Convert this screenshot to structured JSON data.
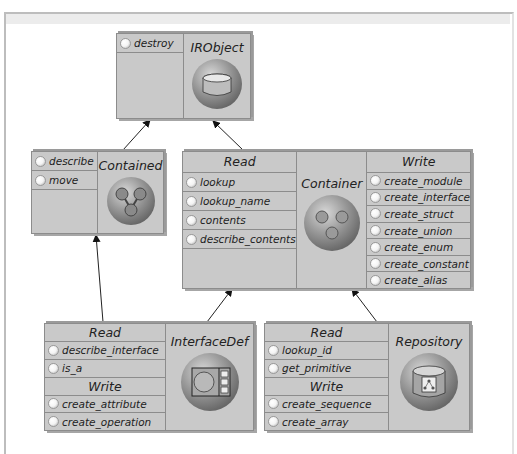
{
  "diagram": {
    "boxes": {
      "irobject": {
        "title": "IRObject",
        "icon": "cylinder-icon",
        "sections": [
          {
            "items": [
              "destroy"
            ]
          }
        ]
      },
      "contained": {
        "title": "Contained",
        "icon": "branch-tree-icon",
        "sections": [
          {
            "items": [
              "describe",
              "move"
            ]
          }
        ]
      },
      "container": {
        "title": "Container",
        "icon": "three-dots-icon",
        "read": {
          "header": "Read",
          "items": [
            "lookup",
            "lookup_name",
            "contents",
            "describe_contents"
          ]
        },
        "write": {
          "header": "Write",
          "items": [
            "create_module",
            "create_interface",
            "create_struct",
            "create_union",
            "create_enum",
            "create_constant",
            "create_alias"
          ]
        }
      },
      "interfacedef": {
        "title": "InterfaceDef",
        "icon": "window-panel-icon",
        "read": {
          "header": "Read",
          "items": [
            "describe_interface",
            "is_a"
          ]
        },
        "write": {
          "header": "Write",
          "items": [
            "create_attribute",
            "create_operation"
          ]
        }
      },
      "repository": {
        "title": "Repository",
        "icon": "repository-cylinder-icon",
        "read": {
          "header": "Read",
          "items": [
            "lookup_id",
            "get_primitive"
          ]
        },
        "write": {
          "header": "Write",
          "items": [
            "create_sequence",
            "create_array"
          ]
        }
      }
    },
    "edges": [
      {
        "from": "Contained",
        "to": "IRObject"
      },
      {
        "from": "Container",
        "to": "IRObject"
      },
      {
        "from": "InterfaceDef",
        "to": "Contained"
      },
      {
        "from": "InterfaceDef",
        "to": "Container"
      },
      {
        "from": "Repository",
        "to": "Container"
      }
    ]
  }
}
